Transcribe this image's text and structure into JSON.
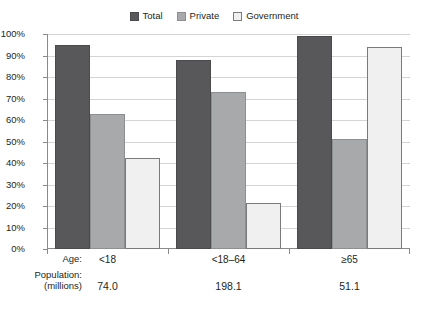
{
  "chart_data": {
    "type": "bar",
    "title": "",
    "subtitle": "",
    "xlabel": "Age:",
    "ylabel": "",
    "ylim": [
      0,
      100
    ],
    "grid": true,
    "legend_position": "top-center",
    "categories": [
      "<18",
      "<18–64",
      "≥65"
    ],
    "series": [
      {
        "name": "Total",
        "color": "#58585a",
        "values": [
          95,
          88,
          99
        ]
      },
      {
        "name": "Private",
        "color": "#a7a9ab",
        "values": [
          63,
          73,
          51
        ]
      },
      {
        "name": "Government",
        "color": "#f0f0f0",
        "values": [
          42.5,
          21.5,
          94
        ]
      }
    ],
    "ytick_labels": [
      "100%",
      "90%",
      "80%",
      "70%",
      "60%",
      "50%",
      "40%",
      "30%",
      "20%",
      "10%",
      "0%"
    ],
    "ytick_values": [
      100,
      90,
      80,
      70,
      60,
      50,
      40,
      30,
      20,
      10,
      0
    ],
    "annotations": {
      "population_caption": "Population:",
      "population_caption_sub": "(millions)",
      "population_values": [
        "74.0",
        "198.1",
        "51.1"
      ]
    }
  },
  "legend": {
    "entries": [
      {
        "label": "Total"
      },
      {
        "label": "Private"
      },
      {
        "label": "Government"
      }
    ]
  },
  "axis": {
    "age_caption": "Age:"
  },
  "colors": {
    "total": "#58585a",
    "private": "#a7a9ab",
    "government": "#f0f0f0",
    "gridline": "#d4d4d4",
    "axis": "#8a8a8a",
    "text": "#231f20"
  }
}
